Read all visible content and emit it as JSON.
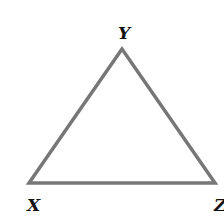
{
  "diagram": {
    "type": "triangle",
    "stroke_color": "#777777",
    "vertices": [
      {
        "label": "Y",
        "position": "top"
      },
      {
        "label": "X",
        "position": "bottom-left"
      },
      {
        "label": "Z",
        "position": "bottom-right"
      }
    ]
  }
}
